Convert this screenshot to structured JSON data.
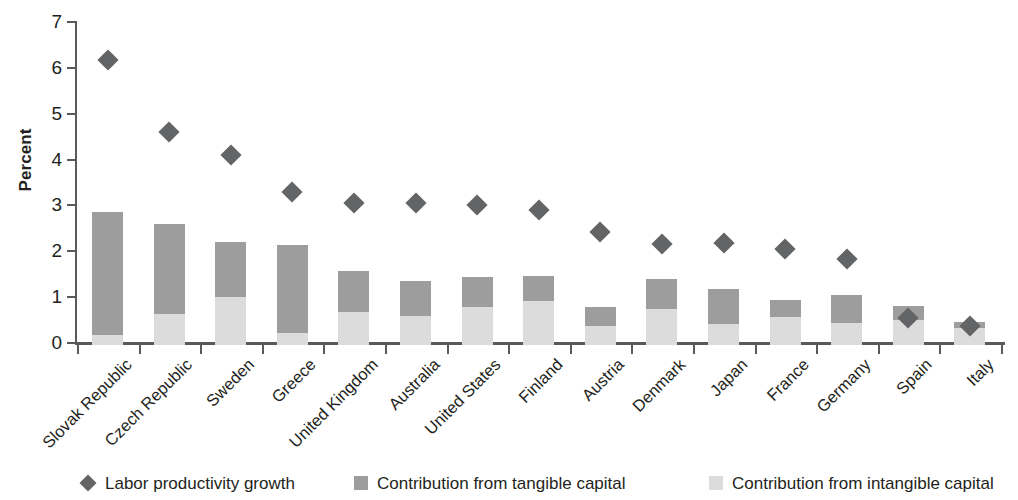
{
  "chart_data": {
    "type": "bar",
    "title": "",
    "subtitle": "",
    "xlabel": "",
    "ylabel": "Percent",
    "ylim": [
      0,
      7
    ],
    "yticks": [
      0,
      1,
      2,
      3,
      4,
      5,
      6,
      7
    ],
    "ytick_labels": [
      "0",
      "1",
      "2",
      "3",
      "4",
      "5",
      "6",
      "7"
    ],
    "grid": false,
    "stacked": true,
    "legend_position": "bottom",
    "categories": [
      "Slovak Republic",
      "Czech Republic",
      "Sweden",
      "Greece",
      "United Kingdom",
      "Australia",
      "United States",
      "Finland",
      "Austria",
      "Denmark",
      "Japan",
      "France",
      "Germany",
      "Spain",
      "Italy"
    ],
    "series": [
      {
        "name": "Contribution from intangible capital",
        "type": "bar-segment",
        "color": "#dcdcdc",
        "values": [
          0.22,
          0.68,
          1.05,
          0.27,
          0.73,
          0.63,
          0.82,
          0.95,
          0.42,
          0.78,
          0.45,
          0.6,
          0.48,
          0.55,
          0.38
        ]
      },
      {
        "name": "Contribution from tangible capital",
        "type": "bar-segment",
        "color": "#9d9d9d",
        "values": [
          2.68,
          1.95,
          1.19,
          1.92,
          0.89,
          0.76,
          0.67,
          0.56,
          0.4,
          0.67,
          0.77,
          0.38,
          0.62,
          0.29,
          0.13
        ]
      },
      {
        "name": "Labor productivity growth",
        "type": "marker-diamond",
        "color": "#636466",
        "values": [
          6.18,
          4.6,
          4.1,
          3.3,
          3.06,
          3.06,
          3.01,
          2.89,
          2.41,
          2.16,
          2.17,
          2.04,
          1.83,
          0.55,
          0.38
        ]
      }
    ],
    "bar_totals": [
      2.9,
      2.63,
      2.24,
      2.19,
      1.62,
      1.39,
      1.49,
      1.51,
      0.82,
      1.45,
      1.22,
      0.98,
      1.1,
      0.84,
      0.51
    ]
  },
  "legend": {
    "items": [
      {
        "label": "Labor productivity growth",
        "marker": "diamond-marker",
        "color": "#636466"
      },
      {
        "label": "Contribution from tangible capital",
        "marker": "square-swatch",
        "color": "#9d9d9d"
      },
      {
        "label": "Contribution from intangible capital",
        "marker": "square-swatch",
        "color": "#dcdcdc"
      }
    ]
  }
}
